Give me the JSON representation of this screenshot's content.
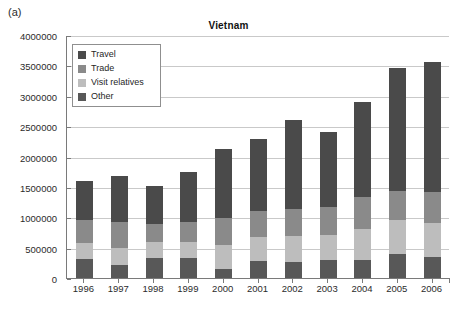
{
  "panel_label": "(a)",
  "chart_data": {
    "type": "bar",
    "subtype": "stacked-bar",
    "title": "Vietnam",
    "xlabel": "",
    "ylabel": "",
    "ylim": [
      0,
      4000000
    ],
    "ytick_step": 500000,
    "ytick_labels": [
      "0",
      "500000",
      "1000000",
      "1500000",
      "2000000",
      "2500000",
      "3000000",
      "3500000",
      "4000000"
    ],
    "ytick_values": [
      0,
      500000,
      1000000,
      1500000,
      2000000,
      2500000,
      3000000,
      3500000,
      4000000
    ],
    "grid": true,
    "legend_position": "top-left-inside",
    "categories": [
      "1996",
      "1997",
      "1998",
      "1999",
      "2000",
      "2001",
      "2002",
      "2003",
      "2004",
      "2005",
      "2006"
    ],
    "stack_order_bottom_to_top": [
      "Other",
      "Visit relatives",
      "Trade",
      "Travel"
    ],
    "series": [
      {
        "name": "Other",
        "color": "#585858",
        "values": [
          320000,
          215000,
          330000,
          335000,
          150000,
          275000,
          270000,
          300000,
          300000,
          400000,
          340000
        ]
      },
      {
        "name": "Visit relatives",
        "color": "#bdbdbd",
        "values": [
          260000,
          280000,
          270000,
          265000,
          400000,
          400000,
          420000,
          400000,
          500000,
          550000,
          560000
        ]
      },
      {
        "name": "Trade",
        "color": "#8a8a8a",
        "values": [
          380000,
          420000,
          290000,
          320000,
          430000,
          430000,
          440000,
          470000,
          540000,
          490000,
          520000
        ]
      },
      {
        "name": "Travel",
        "color": "#4a4a4a",
        "values": [
          630000,
          765000,
          620000,
          830000,
          1140000,
          1190000,
          1470000,
          1230000,
          1560000,
          2010000,
          2140000
        ]
      }
    ],
    "totals": [
      1590000,
      1680000,
      1510000,
      1750000,
      2120000,
      2295000,
      2600000,
      2400000,
      2900000,
      3450000,
      3560000
    ]
  },
  "legend": {
    "items": [
      {
        "label": "Travel",
        "color": "#4a4a4a",
        "icon": "square-swatch-icon"
      },
      {
        "label": "Trade",
        "color": "#8a8a8a",
        "icon": "square-swatch-icon"
      },
      {
        "label": "Visit relatives",
        "color": "#bdbdbd",
        "icon": "square-swatch-icon"
      },
      {
        "label": "Other",
        "color": "#585858",
        "icon": "square-swatch-icon"
      }
    ]
  },
  "colors": {
    "axis": "#7a7a7a",
    "gridline": "#c9c9c9",
    "text": "#1a1a1a",
    "background": "#ffffff"
  }
}
